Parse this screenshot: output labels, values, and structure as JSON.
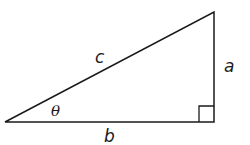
{
  "diagram": {
    "type": "right-triangle",
    "labels": {
      "hypotenuse": "c",
      "opposite": "a",
      "adjacent": "b",
      "angle": "θ"
    },
    "colors": {
      "stroke": "#1a1a1a",
      "background": "#ffffff"
    }
  }
}
